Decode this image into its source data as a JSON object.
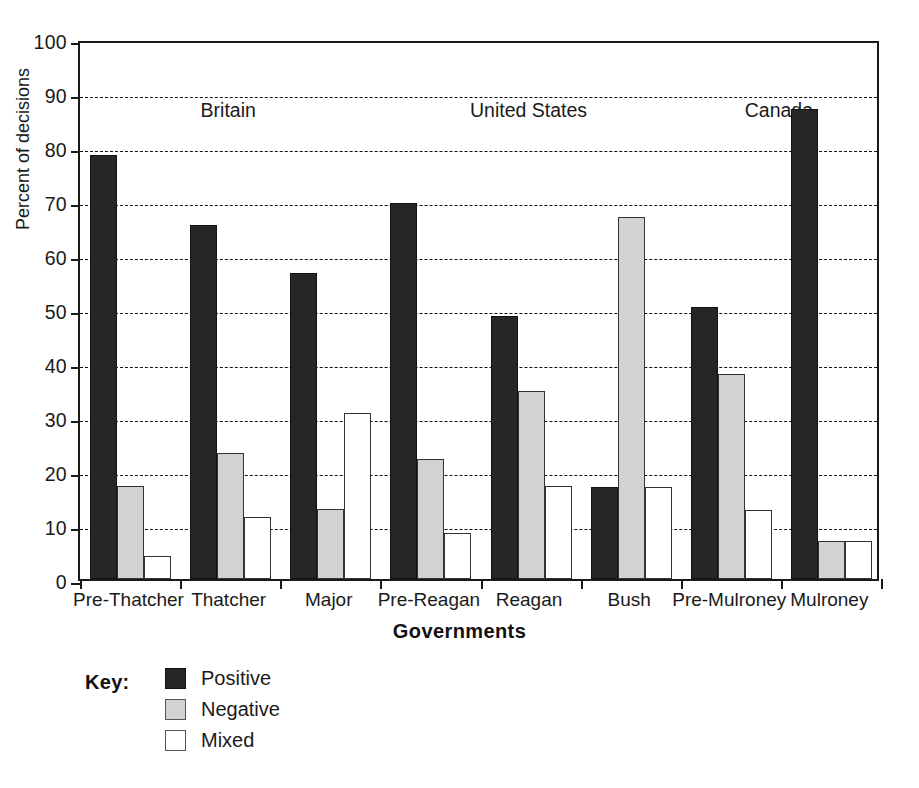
{
  "chart_data": {
    "type": "bar",
    "title": "",
    "xlabel": "Governments",
    "ylabel": "Percent of decisions",
    "ylim": [
      0,
      100
    ],
    "ytick_step": 10,
    "grid": true,
    "grid_style": "dashed-horizontal",
    "legend_position": "below-plot-left",
    "legend_title": "Key:",
    "categories": [
      "Pre-Thatcher",
      "Thatcher",
      "Major",
      "Pre-Reagan",
      "Reagan",
      "Bush",
      "Pre-Mulroney",
      "Mulroney"
    ],
    "yticks": [
      0,
      10,
      20,
      30,
      40,
      50,
      60,
      70,
      80,
      90,
      100
    ],
    "series": [
      {
        "name": "Positive",
        "color": "#262626",
        "values": [
          78.5,
          65.5,
          56.7,
          69.7,
          48.7,
          17.0,
          50.3,
          87.0
        ]
      },
      {
        "name": "Negative",
        "color": "#d2d2d2",
        "values": [
          17.3,
          23.3,
          13.0,
          22.3,
          34.8,
          67.0,
          38.0,
          7.0
        ]
      },
      {
        "name": "Mixed",
        "color": "#ffffff",
        "values": [
          4.3,
          11.5,
          30.7,
          8.5,
          17.3,
          17.0,
          12.7,
          7.0
        ]
      }
    ],
    "annotations": [
      {
        "text": "Britain",
        "covers": [
          "Pre-Thatcher",
          "Thatcher",
          "Major"
        ]
      },
      {
        "text": "United States",
        "covers": [
          "Pre-Reagan",
          "Reagan",
          "Bush"
        ]
      },
      {
        "text": "Canada",
        "covers": [
          "Pre-Mulroney",
          "Mulroney"
        ]
      }
    ]
  }
}
